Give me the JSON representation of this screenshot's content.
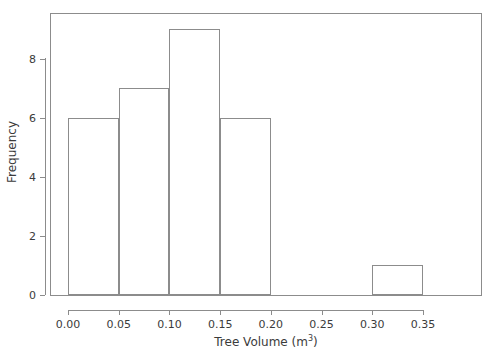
{
  "chart_data": {
    "type": "bar",
    "title": "",
    "subtitle": "",
    "xlabel_text": "Tree Volume (m",
    "xlabel_sup": "3",
    "xlabel_tail": ")",
    "xlabel": "Tree Volume (m3)",
    "ylabel": "Frequency",
    "xlim": [
      0.0,
      0.35
    ],
    "ylim": [
      0,
      9.45
    ],
    "grid": false,
    "legend": null,
    "bin_width": 0.05,
    "bin_edges": [
      0.0,
      0.05,
      0.1,
      0.15,
      0.2,
      0.25,
      0.3,
      0.35
    ],
    "categories": [
      "0.00-0.05",
      "0.05-0.10",
      "0.10-0.15",
      "0.15-0.20",
      "0.20-0.25",
      "0.25-0.30",
      "0.30-0.35"
    ],
    "values": [
      6,
      7,
      9,
      6,
      0,
      0,
      1
    ],
    "xticks": [
      0.0,
      0.05,
      0.1,
      0.15,
      0.2,
      0.25,
      0.3,
      0.35
    ],
    "xtick_labels": [
      "0.00",
      "0.05",
      "0.10",
      "0.15",
      "0.20",
      "0.25",
      "0.30",
      "0.35"
    ],
    "yticks": [
      0,
      2,
      4,
      6,
      8
    ],
    "ytick_labels": [
      "0",
      "2",
      "4",
      "6",
      "8"
    ],
    "bar_edge_color": "#8c8c8c",
    "bar_fill_color": "transparent",
    "axis_color": "#8c8c8c",
    "text_color": "#3b3b3b",
    "background_color": "#ffffff"
  }
}
